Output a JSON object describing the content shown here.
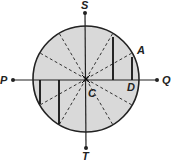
{
  "diagram": {
    "labels": {
      "S": "S",
      "T": "T",
      "P": "P",
      "Q": "Q",
      "A": "A",
      "C": "C",
      "D": "D"
    },
    "colors": {
      "fill": "#d9d9d9",
      "stroke": "#222222",
      "background": "#ffffff"
    },
    "circle": {
      "cx": 86,
      "cy": 79,
      "r": 53
    },
    "dashed_radii_count": 10
  }
}
